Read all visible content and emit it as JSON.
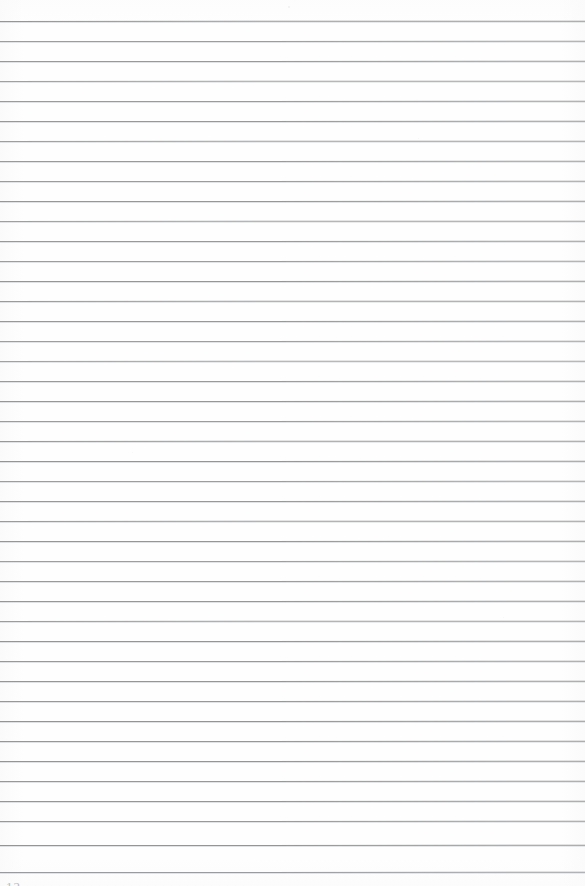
{
  "document": {
    "kind": "scanned-ruled-notebook-page",
    "title": "Blank lined notebook page",
    "page_number": "12",
    "page_number_visible": "partially cropped at bottom edge",
    "body_text": "",
    "handwriting_present": "none",
    "background_color": "#fefefe",
    "rule_color": "#8e9195",
    "page_number_color": "#b9bbbe",
    "width_px": 585,
    "height_px": 886
  },
  "ruling": {
    "line_count": 43,
    "first_line_y": 21,
    "line_spacing_px": 20.1,
    "line_thickness_px": 1,
    "left_margin_px": 0,
    "right_margin_px": 0,
    "margin_rule_present": "none",
    "lines": [
      {
        "y": 21,
        "opacity": 0.95,
        "skew": -0.03,
        "fade_right": 0.62
      },
      {
        "y": 41,
        "opacity": 0.88,
        "skew": -0.02,
        "fade_right": 0.7
      },
      {
        "y": 61,
        "opacity": 0.92,
        "skew": -0.02,
        "fade_right": 0.66
      },
      {
        "y": 81,
        "opacity": 0.85,
        "skew": -0.03,
        "fade_right": 0.74
      },
      {
        "y": 101,
        "opacity": 0.9,
        "skew": -0.02,
        "fade_right": 0.68
      },
      {
        "y": 121,
        "opacity": 0.93,
        "skew": -0.02,
        "fade_right": 0.72
      },
      {
        "y": 141,
        "opacity": 0.87,
        "skew": -0.03,
        "fade_right": 0.78
      },
      {
        "y": 161,
        "opacity": 0.91,
        "skew": -0.02,
        "fade_right": 0.69
      },
      {
        "y": 181,
        "opacity": 0.89,
        "skew": -0.02,
        "fade_right": 0.75
      },
      {
        "y": 201,
        "opacity": 0.94,
        "skew": -0.02,
        "fade_right": 0.71
      },
      {
        "y": 221,
        "opacity": 0.86,
        "skew": -0.03,
        "fade_right": 0.8
      },
      {
        "y": 241,
        "opacity": 0.92,
        "skew": -0.02,
        "fade_right": 0.67
      },
      {
        "y": 261,
        "opacity": 0.88,
        "skew": -0.02,
        "fade_right": 0.76
      },
      {
        "y": 281,
        "opacity": 0.95,
        "skew": -0.02,
        "fade_right": 0.73
      },
      {
        "y": 301,
        "opacity": 0.9,
        "skew": -0.03,
        "fade_right": 0.7
      },
      {
        "y": 321,
        "opacity": 0.93,
        "skew": -0.02,
        "fade_right": 0.78
      },
      {
        "y": 341,
        "opacity": 0.87,
        "skew": -0.02,
        "fade_right": 0.65
      },
      {
        "y": 361,
        "opacity": 0.84,
        "skew": -0.03,
        "fade_right": 0.82
      },
      {
        "y": 381,
        "opacity": 0.91,
        "skew": -0.02,
        "fade_right": 0.72
      },
      {
        "y": 401,
        "opacity": 0.94,
        "skew": -0.02,
        "fade_right": 0.68
      },
      {
        "y": 421,
        "opacity": 0.89,
        "skew": -0.02,
        "fade_right": 0.77
      },
      {
        "y": 441,
        "opacity": 0.92,
        "skew": -0.03,
        "fade_right": 0.7
      },
      {
        "y": 461,
        "opacity": 0.96,
        "skew": -0.02,
        "fade_right": 0.74
      },
      {
        "y": 481,
        "opacity": 0.88,
        "skew": -0.02,
        "fade_right": 0.79
      },
      {
        "y": 501,
        "opacity": 0.93,
        "skew": -0.02,
        "fade_right": 0.66
      },
      {
        "y": 521,
        "opacity": 0.9,
        "skew": -0.03,
        "fade_right": 0.73
      },
      {
        "y": 541,
        "opacity": 0.95,
        "skew": -0.02,
        "fade_right": 0.71
      },
      {
        "y": 561,
        "opacity": 0.87,
        "skew": -0.02,
        "fade_right": 0.8
      },
      {
        "y": 581,
        "opacity": 0.91,
        "skew": -0.02,
        "fade_right": 0.69
      },
      {
        "y": 601,
        "opacity": 0.94,
        "skew": -0.02,
        "fade_right": 0.75
      },
      {
        "y": 621,
        "opacity": 0.89,
        "skew": -0.03,
        "fade_right": 0.67
      },
      {
        "y": 641,
        "opacity": 0.96,
        "skew": -0.02,
        "fade_right": 0.72
      },
      {
        "y": 661,
        "opacity": 0.92,
        "skew": -0.02,
        "fade_right": 0.78
      },
      {
        "y": 681,
        "opacity": 0.95,
        "skew": -0.02,
        "fade_right": 0.7
      },
      {
        "y": 701,
        "opacity": 0.93,
        "skew": -0.02,
        "fade_right": 0.76
      },
      {
        "y": 721,
        "opacity": 0.97,
        "skew": -0.02,
        "fade_right": 0.68
      },
      {
        "y": 741,
        "opacity": 0.94,
        "skew": -0.02,
        "fade_right": 0.74
      },
      {
        "y": 761,
        "opacity": 0.96,
        "skew": -0.02,
        "fade_right": 0.71
      },
      {
        "y": 781,
        "opacity": 0.93,
        "skew": -0.02,
        "fade_right": 0.79
      },
      {
        "y": 801,
        "opacity": 0.95,
        "skew": -0.02,
        "fade_right": 0.73
      },
      {
        "y": 821,
        "opacity": 0.92,
        "skew": -0.02,
        "fade_right": 0.77
      },
      {
        "y": 845,
        "opacity": 0.96,
        "skew": -0.02,
        "fade_right": 0.7
      },
      {
        "y": 872,
        "opacity": 0.9,
        "skew": -0.02,
        "fade_right": 0.66
      }
    ]
  },
  "artifacts": {
    "specks": [
      {
        "x": 288,
        "y": 6,
        "size": 2.0,
        "opacity": 0.45
      },
      {
        "x": 418,
        "y": 138,
        "size": 1.4,
        "opacity": 0.3
      },
      {
        "x": 132,
        "y": 452,
        "size": 1.2,
        "opacity": 0.25
      },
      {
        "x": 503,
        "y": 617,
        "size": 1.3,
        "opacity": 0.28
      }
    ]
  }
}
